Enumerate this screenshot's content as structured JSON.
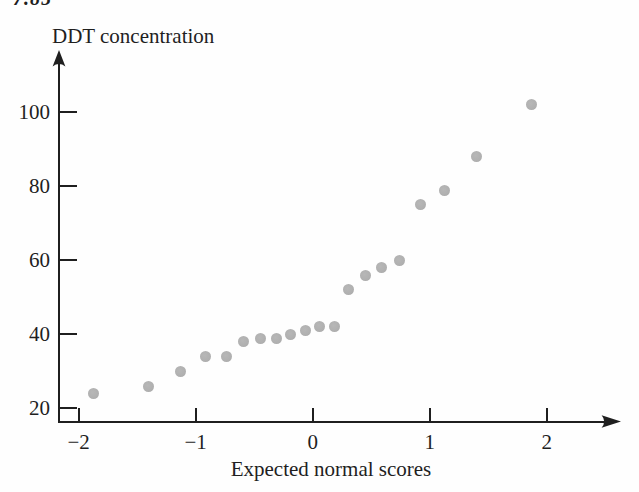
{
  "page": {
    "header_fragment": "7.85",
    "background": "#fefefe"
  },
  "figure": {
    "title": "DDT concentration",
    "x_axis_label": "Expected normal scores",
    "colors": {
      "axis": "#1f1f1f",
      "text": "#1f1f1f",
      "point": "#b0b0b0",
      "background": "#fefefe"
    }
  },
  "chart_data": {
    "type": "scatter",
    "title": "DDT concentration",
    "xlabel": "Expected normal scores",
    "ylabel": "DDT concentration",
    "grid": false,
    "legend": false,
    "x_axis": {
      "min": -2.2,
      "max": 2.6,
      "ticks": [
        -2,
        -1,
        0,
        1,
        2
      ],
      "tick_labels": [
        "−2",
        "−1",
        "0",
        "1",
        "2"
      ]
    },
    "y_axis": {
      "min": 16,
      "max": 112,
      "ticks": [
        20,
        40,
        60,
        80,
        100
      ],
      "tick_labels": [
        "20",
        "40",
        "60",
        "80",
        "100"
      ]
    },
    "points": [
      {
        "score": -1.87,
        "ddt": 24
      },
      {
        "score": -1.4,
        "ddt": 26
      },
      {
        "score": -1.13,
        "ddt": 30
      },
      {
        "score": -0.92,
        "ddt": 34
      },
      {
        "score": -0.74,
        "ddt": 34
      },
      {
        "score": -0.59,
        "ddt": 38
      },
      {
        "score": -0.45,
        "ddt": 39
      },
      {
        "score": -0.31,
        "ddt": 39
      },
      {
        "score": -0.19,
        "ddt": 40
      },
      {
        "score": -0.06,
        "ddt": 41
      },
      {
        "score": 0.06,
        "ddt": 42
      },
      {
        "score": 0.19,
        "ddt": 42
      },
      {
        "score": 0.31,
        "ddt": 52
      },
      {
        "score": 0.45,
        "ddt": 56
      },
      {
        "score": 0.59,
        "ddt": 58
      },
      {
        "score": 0.74,
        "ddt": 60
      },
      {
        "score": 0.92,
        "ddt": 75
      },
      {
        "score": 1.13,
        "ddt": 79
      },
      {
        "score": 1.4,
        "ddt": 88
      },
      {
        "score": 1.87,
        "ddt": 102
      }
    ]
  }
}
